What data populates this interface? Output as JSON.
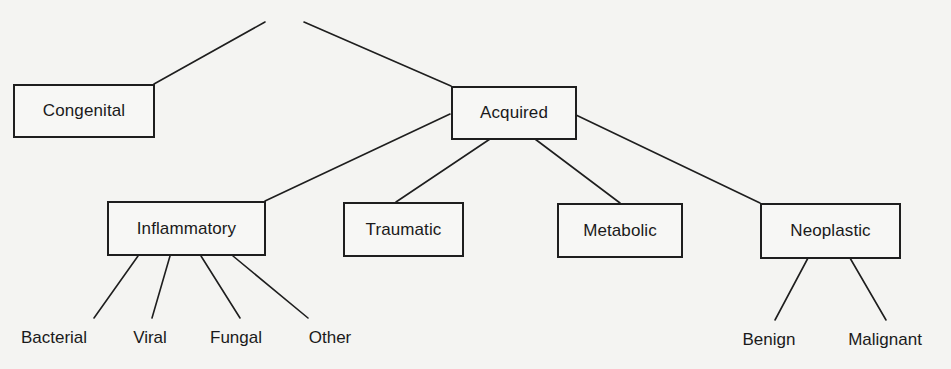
{
  "diagram": {
    "type": "tree",
    "root": {
      "label": "",
      "children": [
        "Congenital",
        "Acquired"
      ]
    },
    "nodes": {
      "congenital": {
        "label": "Congenital"
      },
      "acquired": {
        "label": "Acquired"
      },
      "inflammatory": {
        "label": "Inflammatory"
      },
      "traumatic": {
        "label": "Traumatic"
      },
      "metabolic": {
        "label": "Metabolic"
      },
      "neoplastic": {
        "label": "Neoplastic"
      }
    },
    "leaves": {
      "bacterial": {
        "label": "Bacterial"
      },
      "viral": {
        "label": "Viral"
      },
      "fungal": {
        "label": "Fungal"
      },
      "other": {
        "label": "Other"
      },
      "benign": {
        "label": "Benign"
      },
      "malignant": {
        "label": "Malignant"
      }
    },
    "edges": [
      [
        "root",
        "Congenital"
      ],
      [
        "root",
        "Acquired"
      ],
      [
        "Acquired",
        "Inflammatory"
      ],
      [
        "Acquired",
        "Traumatic"
      ],
      [
        "Acquired",
        "Metabolic"
      ],
      [
        "Acquired",
        "Neoplastic"
      ],
      [
        "Inflammatory",
        "Bacterial"
      ],
      [
        "Inflammatory",
        "Viral"
      ],
      [
        "Inflammatory",
        "Fungal"
      ],
      [
        "Inflammatory",
        "Other"
      ],
      [
        "Neoplastic",
        "Benign"
      ],
      [
        "Neoplastic",
        "Malignant"
      ]
    ],
    "colors": {
      "line": "#1e1e1e",
      "background": "#f4f4f2",
      "text": "#1a1a1a"
    }
  }
}
